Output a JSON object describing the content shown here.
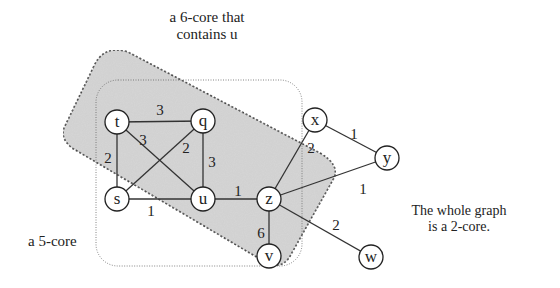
{
  "annotations": {
    "six_core": [
      "a 6-core that",
      "contains u"
    ],
    "five_core": "a 5-core",
    "whole_graph": [
      "The whole graph",
      "is a 2-core."
    ]
  },
  "colors": {
    "six_core_fill": "#d6d6d6",
    "edge": "#333333",
    "node_fill": "#ffffff"
  },
  "nodes": [
    {
      "id": "t",
      "x": 117,
      "y": 122
    },
    {
      "id": "q",
      "x": 203,
      "y": 121
    },
    {
      "id": "s",
      "x": 117,
      "y": 199
    },
    {
      "id": "u",
      "x": 203,
      "y": 199
    },
    {
      "id": "z",
      "x": 269,
      "y": 199
    },
    {
      "id": "v",
      "x": 269,
      "y": 256
    },
    {
      "id": "x",
      "x": 315,
      "y": 120
    },
    {
      "id": "y",
      "x": 387,
      "y": 158
    },
    {
      "id": "w",
      "x": 371,
      "y": 257
    }
  ],
  "edges": [
    {
      "from": "t",
      "to": "q",
      "weight": "3",
      "lx": 160,
      "ly": 112
    },
    {
      "from": "t",
      "to": "u",
      "weight": "3",
      "lx": 143,
      "ly": 142
    },
    {
      "from": "t",
      "to": "s",
      "weight": "2",
      "lx": 108,
      "ly": 160
    },
    {
      "from": "q",
      "to": "s",
      "weight": "2",
      "lx": 186,
      "ly": 150
    },
    {
      "from": "q",
      "to": "u",
      "weight": "3",
      "lx": 212,
      "ly": 164
    },
    {
      "from": "s",
      "to": "u",
      "weight": "1",
      "lx": 151,
      "ly": 213
    },
    {
      "from": "u",
      "to": "z",
      "weight": "1",
      "lx": 238,
      "ly": 193
    },
    {
      "from": "z",
      "to": "x",
      "weight": "2",
      "lx": 311,
      "ly": 150
    },
    {
      "from": "z",
      "to": "y",
      "weight": "1",
      "lx": 363,
      "ly": 191
    },
    {
      "from": "z",
      "to": "v",
      "weight": "6",
      "lx": 261,
      "ly": 235
    },
    {
      "from": "z",
      "to": "w",
      "weight": "2",
      "lx": 336,
      "ly": 227
    },
    {
      "from": "x",
      "to": "y",
      "weight": "1",
      "lx": 354,
      "ly": 136
    }
  ]
}
